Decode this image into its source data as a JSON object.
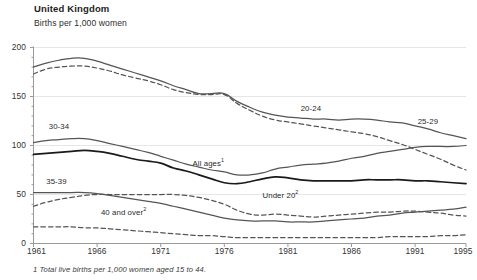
{
  "header": {
    "title": "United Kingdom",
    "subtitle": "Births per 1,000 women"
  },
  "footnote": {
    "text": "1 Total live births per 1,000 women aged 15 to 44."
  },
  "chart_data": {
    "type": "line",
    "title": "United Kingdom",
    "subtitle": "Births per 1,000 women",
    "xlabel": "",
    "ylabel": "Births per 1,000 women",
    "xlim": [
      1961,
      1995
    ],
    "ylim": [
      0,
      200
    ],
    "yticks": [
      0,
      50,
      100,
      150,
      200
    ],
    "xticks": [
      1961,
      1966,
      1971,
      1976,
      1981,
      1986,
      1991,
      1995
    ],
    "grid": "horizontal",
    "legend": "inline-labels",
    "x": [
      1961,
      1962,
      1963,
      1964,
      1965,
      1966,
      1967,
      1968,
      1969,
      1970,
      1971,
      1972,
      1973,
      1974,
      1975,
      1976,
      1977,
      1978,
      1979,
      1980,
      1981,
      1982,
      1983,
      1984,
      1985,
      1986,
      1987,
      1988,
      1989,
      1990,
      1991,
      1992,
      1993,
      1994,
      1995
    ],
    "series": [
      {
        "name": "25-29",
        "label": "25-29",
        "style": "solid",
        "color": "#555555",
        "values": [
          180,
          184,
          187,
          189,
          189,
          186,
          182,
          178,
          174,
          170,
          166,
          161,
          157,
          153,
          153,
          153,
          145,
          139,
          134,
          131,
          129,
          128,
          127,
          127,
          126,
          127,
          127,
          126,
          124,
          123,
          120,
          117,
          113,
          110,
          107
        ]
      },
      {
        "name": "20-24",
        "label": "20-24",
        "style": "dashed",
        "color": "#555555",
        "values": [
          173,
          178,
          180,
          181,
          181,
          179,
          176,
          172,
          169,
          166,
          162,
          157,
          154,
          152,
          152,
          152,
          143,
          136,
          130,
          126,
          124,
          122,
          120,
          118,
          116,
          114,
          112,
          109,
          105,
          101,
          96,
          91,
          86,
          80,
          75
        ]
      },
      {
        "name": "30-34",
        "label": "30-34",
        "style": "solid",
        "color": "#555555",
        "values": [
          103,
          105,
          106,
          107,
          107,
          105,
          102,
          99,
          96,
          93,
          89,
          85,
          81,
          78,
          75,
          73,
          70,
          70,
          72,
          76,
          78,
          80,
          81,
          82,
          84,
          87,
          89,
          92,
          94,
          96,
          98,
          99,
          99,
          99,
          100
        ]
      },
      {
        "name": "All ages",
        "label": "All ages",
        "labelSup": "1",
        "style": "solid",
        "color": "#1a1a1a",
        "values": [
          91,
          92,
          93,
          94,
          95,
          94,
          92,
          89,
          86,
          84,
          82,
          77,
          74,
          70,
          66,
          62,
          61,
          63,
          66,
          68,
          67,
          65,
          64,
          64,
          64,
          64,
          65,
          65,
          65,
          65,
          64,
          64,
          63,
          62,
          61
        ]
      },
      {
        "name": "35-39",
        "label": "35-39",
        "style": "solid",
        "color": "#555555",
        "values": [
          52,
          52,
          52,
          52,
          52,
          51,
          49,
          47,
          45,
          43,
          41,
          38,
          35,
          32,
          29,
          26,
          24,
          23,
          23,
          23,
          22,
          22,
          22,
          23,
          24,
          25,
          26,
          28,
          29,
          31,
          32,
          33,
          34,
          35,
          37
        ]
      },
      {
        "name": "Under 20",
        "label": "Under 20",
        "labelSup": "2",
        "style": "dashed",
        "color": "#555555",
        "values": [
          38,
          42,
          45,
          47,
          49,
          50,
          50,
          50,
          50,
          50,
          50,
          50,
          49,
          47,
          44,
          40,
          34,
          30,
          29,
          30,
          29,
          28,
          27,
          28,
          29,
          30,
          31,
          32,
          32,
          33,
          33,
          32,
          31,
          29,
          28
        ]
      },
      {
        "name": "40 and over",
        "label": "40 and over",
        "labelSup": "2",
        "style": "dashed",
        "color": "#555555",
        "values": [
          17,
          17,
          17,
          17,
          16,
          16,
          15,
          14,
          13,
          12,
          11,
          10,
          9,
          8,
          8,
          7,
          6,
          6,
          6,
          6,
          6,
          6,
          6,
          6,
          6,
          6,
          6,
          6,
          7,
          7,
          7,
          7,
          8,
          8,
          9
        ]
      }
    ],
    "annotations": [
      {
        "text": "30-34",
        "x": 1962.2,
        "y": 118
      },
      {
        "text": "25-29",
        "x": 1991.2,
        "y": 123
      },
      {
        "text": "20-24",
        "x": 1982.0,
        "y": 136
      },
      {
        "text": "All ages",
        "sup": "1",
        "x": 1973.5,
        "y": 80
      },
      {
        "text": "35-39",
        "x": 1962.0,
        "y": 62
      },
      {
        "text": "Under 20",
        "sup": "2",
        "x": 1979.0,
        "y": 47
      },
      {
        "text": "40 and over",
        "sup": "2",
        "x": 1966.3,
        "y": 30
      }
    ]
  },
  "axis": {
    "ylabels": [
      "200",
      "150",
      "100",
      "50",
      "0"
    ],
    "xlabels": [
      "1961",
      "1966",
      "1971",
      "1976",
      "1981",
      "1986",
      "1991",
      "1995"
    ]
  },
  "colors": {
    "line_dark": "#1a1a1a",
    "line_grey": "#555555",
    "axis": "#9a9a9a",
    "grid": "#e6e6e6",
    "text": "#2b2b2b"
  }
}
